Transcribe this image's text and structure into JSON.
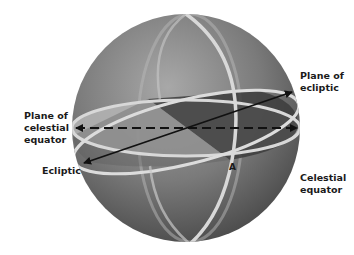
{
  "diagram": {
    "labels": {
      "plane_of_celestial_equator": [
        "Plane of",
        "celestial",
        "equator"
      ],
      "plane_of_ecliptic": [
        "Plane of",
        "ecliptic"
      ],
      "ecliptic": "Ecliptic",
      "celestial_equator": [
        "Celestial",
        "equator"
      ],
      "point_a": "A"
    },
    "colors": {
      "sphere_light": "#9a9a9a",
      "sphere_dark": "#4a4a4a",
      "ring": "#d8d8d8",
      "equator_plane": "#b4b4b4",
      "ecliptic_plane": "#3c3c3c",
      "arrow": "#111111"
    }
  }
}
